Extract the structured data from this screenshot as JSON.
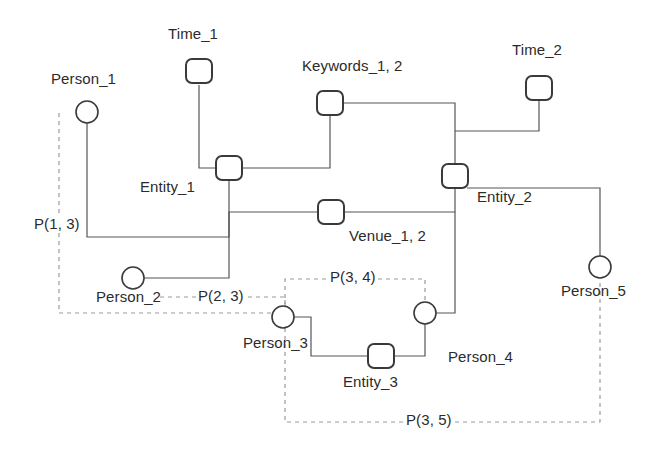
{
  "diagram": {
    "stroke_color": "#555555",
    "dashed_color": "#9a9a9a",
    "text_color": "#2b2b2b",
    "background": "#ffffff",
    "width": 668,
    "height": 450
  },
  "nodes": [
    {
      "id": "time_1",
      "type": "square",
      "label": "Time_1",
      "cx": 199,
      "cy": 71,
      "label_x": 168,
      "label_y": 25
    },
    {
      "id": "person_1",
      "type": "circle",
      "label": "Person_1",
      "cx": 87,
      "cy": 112,
      "label_x": 51,
      "label_y": 70
    },
    {
      "id": "entity_1",
      "type": "square",
      "label": "Entity_1",
      "cx": 229,
      "cy": 168,
      "label_x": 140,
      "label_y": 178
    },
    {
      "id": "keywords_1_2",
      "type": "square",
      "label": "Keywords_1, 2",
      "cx": 330,
      "cy": 103,
      "label_x": 302,
      "label_y": 57
    },
    {
      "id": "time_2",
      "type": "square",
      "label": "Time_2",
      "cx": 539,
      "cy": 88,
      "label_x": 512,
      "label_y": 41
    },
    {
      "id": "entity_2",
      "type": "square",
      "label": "Entity_2",
      "cx": 455,
      "cy": 176,
      "label_x": 477,
      "label_y": 188
    },
    {
      "id": "venue_1_2",
      "type": "square",
      "label": "Venue_1, 2",
      "cx": 331,
      "cy": 212,
      "label_x": 349,
      "label_y": 227
    },
    {
      "id": "person_2",
      "type": "circle",
      "label": "Person_2",
      "cx": 133,
      "cy": 278,
      "label_x": 96,
      "label_y": 288
    },
    {
      "id": "person_3",
      "type": "circle",
      "label": "Person_3",
      "cx": 283,
      "cy": 317,
      "label_x": 243,
      "label_y": 334
    },
    {
      "id": "person_4",
      "type": "circle",
      "label": "Person_4",
      "cx": 425,
      "cy": 313,
      "label_x": 448,
      "label_y": 348
    },
    {
      "id": "entity_3",
      "type": "square",
      "label": "Entity_3",
      "cx": 381,
      "cy": 356,
      "label_x": 343,
      "label_y": 373
    },
    {
      "id": "person_5",
      "type": "circle",
      "label": "Person_5",
      "cx": 600,
      "cy": 267,
      "label_x": 561,
      "label_y": 282
    }
  ],
  "solid_edges": [
    {
      "id": "time1-entity1",
      "points": "199,85 199,168 216,168"
    },
    {
      "id": "person1-entity1",
      "points": "87,123 87,237 229,237 229,180"
    },
    {
      "id": "keywords-entity1",
      "points": "330,115 330,168 242,168"
    },
    {
      "id": "keywords-entity2",
      "points": "338,103 455,103 455,164"
    },
    {
      "id": "time2-entity2",
      "points": "539,100 539,131 455,131"
    },
    {
      "id": "venue-entity1",
      "points": "319,212 229,212 229,237"
    },
    {
      "id": "venue-entity2",
      "points": "343,212 455,212 455,188"
    },
    {
      "id": "person2-entity1",
      "points": "144,278 229,278 229,237"
    },
    {
      "id": "person4-entity2",
      "points": "436,313 455,313 455,212"
    },
    {
      "id": "person5-entity2",
      "points": "600,256 600,188 467,188"
    },
    {
      "id": "person3-entity3",
      "points": "294,317 311,317 311,356 368,356"
    },
    {
      "id": "entity3-person4",
      "points": "394,356 425,356 425,324"
    }
  ],
  "dashed_edges": [
    {
      "id": "p13",
      "label": "P(1, 3)",
      "points": "59,113 59,313 272,313",
      "label_x": 32,
      "label_y": 215
    },
    {
      "id": "p23",
      "label": "P(2, 3)",
      "points": "160,297 285,297 285,306",
      "label_x": 196,
      "label_y": 287
    },
    {
      "id": "p34",
      "label": "P(3, 4)",
      "points": "285,306 285,279 425,279 425,302",
      "label_x": 328,
      "label_y": 268
    },
    {
      "id": "p35",
      "label": "P(3, 5)",
      "points": "285,328 285,422 600,422 600,278",
      "label_x": 404,
      "label_y": 411
    }
  ]
}
